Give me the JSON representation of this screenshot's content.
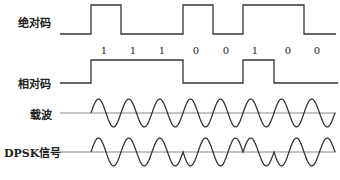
{
  "diagram": {
    "line_color": "#333333",
    "axis_color": "#888888",
    "rows": [
      {
        "id": "absolute",
        "label": "绝对码",
        "label_x": 18,
        "label_y": 14
      },
      {
        "id": "relative",
        "label": "相对码",
        "label_x": 18,
        "label_y": 75
      },
      {
        "id": "carrier",
        "label": "载波",
        "label_x": 30,
        "label_y": 106
      },
      {
        "id": "dpsk",
        "label": "DPSK信号",
        "label_x": 4,
        "label_y": 144
      }
    ],
    "bits": [
      "1",
      "1",
      "1",
      "0",
      "0",
      "1",
      "0",
      "0"
    ],
    "bit_label_x": [
      104,
      133,
      162,
      196,
      226,
      255,
      288,
      317
    ],
    "bit_label_y": 45,
    "bit_boundaries": [
      91,
      121,
      152,
      183,
      213,
      243,
      274,
      304,
      335
    ],
    "absolute_code_levels": [
      1,
      0,
      0,
      1,
      0,
      1,
      1,
      0
    ],
    "relative_code_levels": [
      1,
      1,
      1,
      0,
      0,
      1,
      0,
      0
    ],
    "absolute_wave": {
      "x_start": 60,
      "x_end": 336,
      "y_high": 5,
      "y_low": 34
    },
    "relative_wave": {
      "x_start": 60,
      "x_end": 338,
      "y_high": 60,
      "y_low": 83
    },
    "carrier_wave": {
      "x_start": 88,
      "x_end": 336,
      "baseline_y": 113,
      "amplitude": 14,
      "cycles_per_bit": 1,
      "axis_x_start": 60
    },
    "dpsk_wave": {
      "x_start": 88,
      "x_end": 336,
      "baseline_y": 152,
      "amplitude": 14,
      "cycles_per_bit": 1,
      "axis_x_start": 60
    }
  }
}
